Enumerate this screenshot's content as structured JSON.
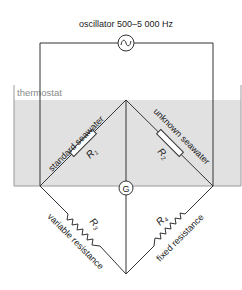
{
  "title": "oscillator 500–5 000 Hz",
  "thermostat": {
    "label": "thermostat",
    "fill_color": "#e1e1e1",
    "border_color": "#9a9a9a"
  },
  "galvanometer": {
    "label": "G"
  },
  "resistors": {
    "r1": {
      "symbol": "R",
      "subscript": "1",
      "description": "standard seawater"
    },
    "r2": {
      "symbol": "R",
      "subscript": "2",
      "description": "unknown seawater"
    },
    "r3": {
      "symbol": "R",
      "subscript": "3",
      "description": "variable resistance"
    },
    "r4": {
      "symbol": "R",
      "subscript": "4",
      "description": "fixed resistance"
    }
  },
  "oscillator": {
    "icon": "sine-wave-icon"
  },
  "colors": {
    "wire": "#333333",
    "text": "#222222",
    "resistor_fill": "#ffffff"
  }
}
